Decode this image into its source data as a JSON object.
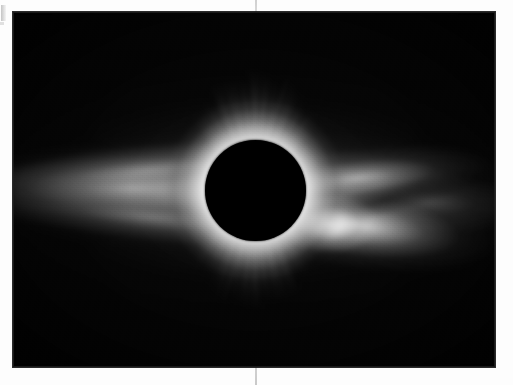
{
  "page": {
    "kind": "scanned-page",
    "background_color": "#fdfdfd",
    "gutter_line_color": "#cdcdcd"
  },
  "figure": {
    "name": "total-solar-eclipse-photograph",
    "caption": "",
    "plate": {
      "x": 13,
      "y": 12,
      "width": 482,
      "height": 355,
      "background_color": "#050505",
      "border_color": "#232323"
    },
    "occulting_disk": {
      "name": "lunar-disk",
      "center_x": 242,
      "center_y": 178,
      "radius": 50,
      "color": "#000000"
    },
    "corona": {
      "description": "Bright equatorial streamers extending left and right, fine polar plumes above and below, brightest helmet streamer on the lower right limb",
      "highlight_color": "#ffffff",
      "midtone_color": "#b4b4b4",
      "shadow_color": "#050505",
      "features": [
        {
          "name": "equatorial-streamer-belt",
          "orientation": "horizontal"
        },
        {
          "name": "west-streamer-fan",
          "side": "left"
        },
        {
          "name": "east-helmet-streamer",
          "side": "lower-right",
          "brightness": "brightest"
        },
        {
          "name": "east-upper-streamer",
          "side": "upper-right"
        },
        {
          "name": "north-polar-plumes",
          "side": "top"
        },
        {
          "name": "south-polar-plumes",
          "side": "bottom"
        },
        {
          "name": "inner-corona-ring",
          "side": "limb"
        }
      ]
    }
  },
  "artifacts": {
    "margin_tick": "scan-edge-mark",
    "gutter": "page-fold-line"
  }
}
